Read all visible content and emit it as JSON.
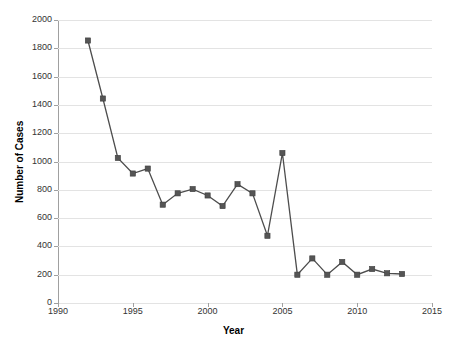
{
  "chart_data": {
    "type": "line",
    "title": "",
    "xlabel": "Year",
    "ylabel": "Number of Cases",
    "xlim": [
      1990,
      2015
    ],
    "ylim": [
      0,
      2000
    ],
    "grid": true,
    "legend": null,
    "x_ticks": [
      1990,
      1995,
      2000,
      2005,
      2010,
      2015
    ],
    "y_ticks": [
      0,
      200,
      400,
      600,
      800,
      1000,
      1200,
      1400,
      1600,
      1800,
      2000
    ],
    "marker": "square",
    "series_color": "#4d4d4d",
    "x": [
      1992,
      1993,
      1994,
      1995,
      1996,
      1997,
      1998,
      1999,
      2000,
      2001,
      2002,
      2003,
      2004,
      2005,
      2006,
      2007,
      2008,
      2009,
      2010,
      2011,
      2012,
      2013
    ],
    "values": [
      1855,
      1445,
      1025,
      915,
      950,
      695,
      775,
      805,
      760,
      685,
      840,
      775,
      475,
      1060,
      200,
      315,
      200,
      290,
      200,
      240,
      210,
      205
    ],
    "series": [
      {
        "name": "Number of Cases",
        "values": [
          1855,
          1445,
          1025,
          915,
          950,
          695,
          775,
          805,
          760,
          685,
          840,
          775,
          475,
          1060,
          200,
          315,
          200,
          290,
          200,
          240,
          210,
          205
        ]
      }
    ]
  }
}
